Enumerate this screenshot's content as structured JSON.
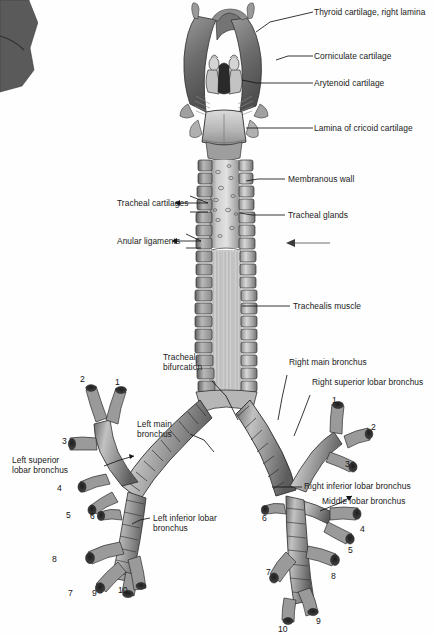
{
  "figure": {
    "background_color": "#fefefe",
    "ink_color": "#1a1a1a"
  },
  "labels": {
    "thyroid_cartilage_right_lamina": "Thyroid cartilage, right lamina",
    "corniculate_cartilage": "Corniculate cartilage",
    "arytenoid_cartilage": "Arytenoid cartilage",
    "lamina_of_cricoid_cartilage": "Lamina of cricoid cartilage",
    "membranous_wall": "Membranous wall",
    "tracheal_glands": "Tracheal glands",
    "trachealis_muscle": "Trachealis muscle",
    "tracheal_cartilages": "Tracheal cartilages",
    "anular_ligaments": "Anular ligaments",
    "tracheal_bifurcation_line1": "Tracheal",
    "tracheal_bifurcation_line2": "bifurcation",
    "left_main_bronchus_line1": "Left main",
    "left_main_bronchus_line2": "bronchus",
    "right_main_bronchus": "Right main bronchus",
    "right_superior_lobar_bronchus": "Right superior lobar bronchus",
    "right_inferior_lobar_bronchus": "Right inferior lobar bronchus",
    "middle_lobar_bronchus": "Middle lobar bronchus",
    "left_superior_lobar_bronchus_line1": "Left superior",
    "left_superior_lobar_bronchus_line2": "lobar bronchus",
    "left_inferior_lobar_bronchus_line1": "Left inferior lobar",
    "left_inferior_lobar_bronchus_line2": "bronchus"
  },
  "segment_numbers": {
    "left_tree": [
      "2",
      "1",
      "3",
      "4",
      "5",
      "6",
      "8",
      "7",
      "9",
      "10"
    ],
    "right_tree": [
      "1",
      "2",
      "3",
      "4",
      "5",
      "6",
      "7",
      "8",
      "9",
      "10"
    ]
  }
}
